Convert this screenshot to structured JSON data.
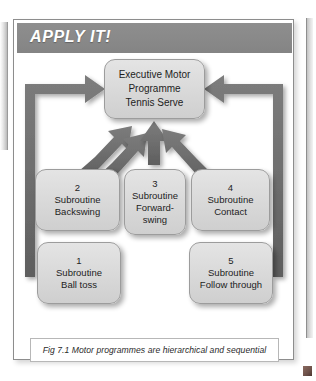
{
  "page": {
    "edge_left_icon": "page-edge-sliver",
    "edge_right_icon": "page-edge-sliver",
    "corner_mark_icon": "page-corner-mark"
  },
  "card": {
    "header": {
      "title": "APPLY IT!",
      "background_color": "#8a8a8a",
      "text_color": "#ffffff"
    },
    "border_color": "#8d8d8d"
  },
  "diagram": {
    "node_fill_color": "#dcdcdc",
    "node_border_color": "#9c9c9c",
    "arrow_color": "#6f6f6f",
    "nodes": [
      {
        "id": "executive",
        "name": "executive-motor-programme",
        "lines": [
          "Executive Motor",
          "Programme",
          "Tennis Serve"
        ]
      },
      {
        "id": "sub1",
        "name": "subroutine-ball-toss",
        "number": "1",
        "lines": [
          "1",
          "Subroutine",
          "Ball toss"
        ]
      },
      {
        "id": "sub2",
        "name": "subroutine-backswing",
        "number": "2",
        "lines": [
          "2",
          "Subroutine",
          "Backswing"
        ]
      },
      {
        "id": "sub3",
        "name": "subroutine-forward-swing",
        "number": "3",
        "lines": [
          "3",
          "Subroutine",
          "Forward-",
          "swing"
        ]
      },
      {
        "id": "sub4",
        "name": "subroutine-contact",
        "number": "4",
        "lines": [
          "4",
          "Subroutine",
          "Contact"
        ]
      },
      {
        "id": "sub5",
        "name": "subroutine-follow-through",
        "number": "5",
        "lines": [
          "5",
          "Subroutine",
          "Follow through"
        ]
      }
    ],
    "arrows": [
      {
        "name": "arrow-ball-toss-to-executive",
        "style": "bracket-left"
      },
      {
        "name": "arrow-backswing-to-executive",
        "style": "diagonal"
      },
      {
        "name": "arrow-backswing-to-executive-inner",
        "style": "diagonal"
      },
      {
        "name": "arrow-forward-swing-to-executive",
        "style": "vertical"
      },
      {
        "name": "arrow-contact-to-executive",
        "style": "diagonal"
      },
      {
        "name": "arrow-follow-through-to-executive",
        "style": "bracket-right"
      }
    ]
  },
  "caption": {
    "text": "Fig 7.1 Motor programmes are hierarchical and sequential"
  }
}
